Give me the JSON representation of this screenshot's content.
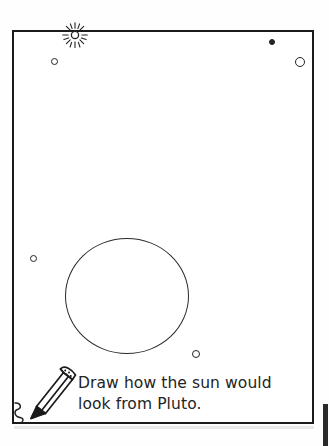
{
  "page": {
    "kind": "worksheet-activity-page",
    "background_color": "#ffffff",
    "ink_color": "#232323"
  },
  "frame": {
    "label": "activity-border",
    "stroke_color": "#1b1b1b"
  },
  "instruction": {
    "text": "Draw how the sun would\nlook from Pluto.",
    "line1": "Draw how the sun would",
    "line2": "look from Pluto.",
    "color": "#242424"
  },
  "icons": {
    "sun": {
      "name": "sun-icon",
      "rays": 12,
      "color": "#232323"
    },
    "pencil": {
      "name": "pencil-icon",
      "color": "#1a1a1a"
    },
    "squiggle": {
      "name": "squiggle-mark",
      "color": "#232323"
    }
  },
  "drawing_area": {
    "name": "drawing-circle",
    "shape": "circle",
    "stroke_color": "#2b2b2b",
    "filled": false
  },
  "stars": [
    {
      "name": "star-dot-upper-left",
      "x": 51,
      "y": 58,
      "size": 5,
      "filled": false
    },
    {
      "name": "star-dot-upper-right",
      "x": 269,
      "y": 39,
      "size": 4,
      "filled": true
    },
    {
      "name": "star-circle-right",
      "x": 295,
      "y": 57,
      "size": 8,
      "filled": false
    },
    {
      "name": "star-dot-mid-left",
      "x": 30,
      "y": 255,
      "size": 5,
      "filled": false
    },
    {
      "name": "star-dot-lower-middle",
      "x": 192,
      "y": 350,
      "size": 6,
      "filled": false
    }
  ]
}
